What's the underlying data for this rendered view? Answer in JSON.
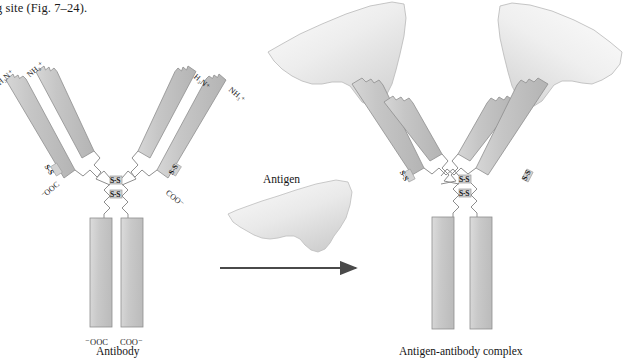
{
  "figure": {
    "top_text": "g site (Fig. 7–24).",
    "antigen_label": "Antigen",
    "captions": {
      "left": "Antibody",
      "right": "Antigen-antibody complex"
    },
    "colors": {
      "chain_fill": "#c3c3c3",
      "chain_stroke": "#8f8f8f",
      "antigen_fill": "#e6e6e6",
      "antigen_stroke": "#b5b5b5",
      "arrow": "#4a4a4a",
      "text": "#1a1a1a"
    }
  },
  "antibody_left": {
    "name": "Antibody",
    "terminus_labels": {
      "heavy_left_n": "H₃N⁺",
      "light_left_n": "NH₃⁺",
      "heavy_right_n": "H₃N⁺",
      "light_right_n": "NH₃⁺",
      "light_left_c": "⁻OOC",
      "light_right_c": "COO⁻",
      "heavy_left_c": "⁻OOC",
      "heavy_right_c": "COO⁻"
    },
    "disulfides": {
      "arm_left": "S-S",
      "arm_right": "S-S",
      "hinge_upper": "S-S",
      "hinge_lower": "S-S"
    }
  },
  "antibody_right": {
    "name": "Antigen-antibody complex",
    "disulfides": {
      "arm_left": "S-S",
      "arm_right": "S-S",
      "hinge_upper": "S-S",
      "hinge_lower": "S-S"
    },
    "antigens": [
      {
        "id": "antigen-bound-left"
      },
      {
        "id": "antigen-bound-right"
      }
    ]
  },
  "arrow": {
    "direction": "right",
    "name": "transformation-arrow"
  }
}
